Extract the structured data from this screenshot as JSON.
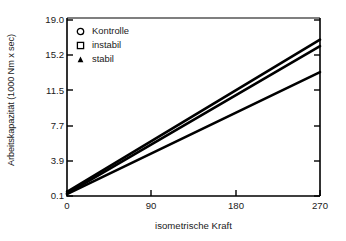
{
  "chart_data": {
    "type": "line",
    "title": "",
    "xlabel": "isometrische Kraft",
    "ylabel": "Arbeitskapazität (1000 Nm x sec)",
    "xlim": [
      0,
      270
    ],
    "ylim": [
      0.1,
      19.0
    ],
    "xticks": [
      "0",
      "90",
      "180",
      "270"
    ],
    "xtick_values": [
      0,
      90,
      180,
      270
    ],
    "yticks": [
      "0.1",
      "3.9",
      "7.7",
      "11.5",
      "15.2",
      "19.0"
    ],
    "ytick_values": [
      0.1,
      3.9,
      7.7,
      11.5,
      15.2,
      19.0
    ],
    "grid": false,
    "legend_position": "upper-left-inside",
    "series": [
      {
        "name": "Kontrolle",
        "marker": "open-circle",
        "x": [
          0,
          270
        ],
        "values": [
          0.55,
          16.9
        ]
      },
      {
        "name": "instabil",
        "marker": "open-square",
        "x": [
          0,
          270
        ],
        "values": [
          0.35,
          16.2
        ]
      },
      {
        "name": "stabil",
        "marker": "filled-triangle",
        "x": [
          0,
          270
        ],
        "values": [
          0.3,
          13.4
        ]
      }
    ]
  },
  "legend": {
    "items": [
      {
        "label": "Kontrolle",
        "marker": "open-circle"
      },
      {
        "label": "instabil",
        "marker": "open-square"
      },
      {
        "label": "stabil",
        "marker": "filled-triangle"
      }
    ]
  },
  "axes": {
    "y_title": "Arbeitskapazität (1000 Nm x sec)",
    "x_title": "isometrische Kraft",
    "y_tick_labels": [
      "19.0",
      "15.2",
      "11.5",
      "7.7",
      "3.9",
      "0.1"
    ],
    "x_tick_labels": [
      "0",
      "90",
      "180",
      "270"
    ]
  },
  "colors": {
    "line": "#000000",
    "axis": "#000000",
    "text": "#1a1a1a",
    "background": "#ffffff"
  }
}
